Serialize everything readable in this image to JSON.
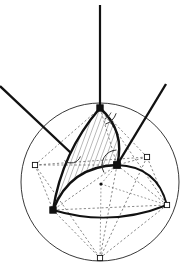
{
  "figure": {
    "type": "geometric-diagram",
    "title": "",
    "caption": "",
    "canvas": {
      "width": 186,
      "height": 278,
      "background": "#ffffff"
    },
    "colors": {
      "stroke_primary": "#111111",
      "stroke_thin": "#333333",
      "stroke_dashed": "#555555",
      "hatch": "#444444",
      "vertex_fill": "#ffffff",
      "vertex_stroke": "#111111"
    },
    "great_circle": {
      "label": "sphere-outline",
      "cx": 100,
      "cy": 182,
      "r": 79,
      "stroke_width": 0.9
    },
    "vertices": [
      {
        "name": "top",
        "x": 100,
        "y": 108,
        "marker": "square",
        "size": 3.2
      },
      {
        "name": "lower-left",
        "x": 53,
        "y": 210,
        "marker": "square",
        "size": 3.2
      },
      {
        "name": "mid-right",
        "x": 117,
        "y": 165,
        "marker": "square",
        "size": 3.4
      },
      {
        "name": "far-right",
        "x": 167,
        "y": 205,
        "marker": "square",
        "size": 2.6
      },
      {
        "name": "far-left",
        "x": 35,
        "y": 165,
        "marker": "square",
        "size": 2.6
      },
      {
        "name": "upper-right",
        "x": 147,
        "y": 157,
        "marker": "square",
        "size": 2.6
      },
      {
        "name": "bottom",
        "x": 100,
        "y": 258,
        "marker": "square",
        "size": 2.6
      },
      {
        "name": "center",
        "x": 101,
        "y": 184,
        "marker": "dot",
        "size": 1.6
      }
    ],
    "spherical_triangle": {
      "name": "hatched-spherical-triangle",
      "arcs": [
        {
          "from": "top",
          "to": "mid-right",
          "bulge": 9,
          "stroke_width": 2.4
        },
        {
          "from": "mid-right",
          "to": "lower-left",
          "bulge": 13,
          "stroke_width": 2.4
        },
        {
          "from": "lower-left",
          "to": "top",
          "bulge": 8,
          "stroke_width": 2.4
        }
      ],
      "hatching": {
        "angle_deg": 20,
        "spacing": 4.5,
        "stroke_width": 0.7
      }
    },
    "spherical_arcs_outer": [
      {
        "name": "arc-midright-farright",
        "from": "mid-right",
        "to": "far-right",
        "bulge": 12,
        "stroke_width": 1.9
      },
      {
        "name": "arc-lowerleft-farright",
        "from": "lower-left",
        "to": "far-right",
        "bulge": 10,
        "stroke_width": 1.9
      }
    ],
    "octahedron_dashed_edges": [
      {
        "from": "far-left",
        "to": "top"
      },
      {
        "from": "far-left",
        "to": "mid-right"
      },
      {
        "from": "far-left",
        "to": "lower-left"
      },
      {
        "from": "far-left",
        "to": "bottom"
      },
      {
        "from": "far-left",
        "to": "upper-right"
      },
      {
        "from": "top",
        "to": "upper-right"
      },
      {
        "from": "top",
        "to": "mid-right"
      },
      {
        "from": "top",
        "to": "far-right"
      },
      {
        "from": "upper-right",
        "to": "mid-right"
      },
      {
        "from": "upper-right",
        "to": "far-right"
      },
      {
        "from": "upper-right",
        "to": "bottom"
      },
      {
        "from": "mid-right",
        "to": "far-right"
      },
      {
        "from": "mid-right",
        "to": "bottom"
      },
      {
        "from": "mid-right",
        "to": "lower-left"
      },
      {
        "from": "lower-left",
        "to": "bottom"
      },
      {
        "from": "lower-left",
        "to": "far-right"
      },
      {
        "from": "far-right",
        "to": "bottom"
      }
    ],
    "center_spokes_dashed": [
      {
        "from": "center",
        "to": "mid-right"
      },
      {
        "from": "center",
        "to": "bottom"
      },
      {
        "from": "center",
        "to": "far-right"
      }
    ],
    "rays": [
      {
        "name": "ray-vertical-top",
        "x1": 100,
        "y1": 5,
        "x2": 100,
        "y2": 108,
        "stroke_width": 2.2
      },
      {
        "name": "ray-upper-left",
        "x1": 0,
        "y1": 86,
        "x2": 71,
        "y2": 153,
        "stroke_width": 2.4
      },
      {
        "name": "ray-upper-right",
        "x1": 166,
        "y1": 84,
        "x2": 117,
        "y2": 165,
        "stroke_width": 2.4
      }
    ],
    "angle_arcs": [
      {
        "name": "angle-arc-top",
        "cx": 100,
        "cy": 108,
        "r": 17,
        "start_deg": 18,
        "end_deg": 72,
        "stroke_width": 1.0
      },
      {
        "name": "angle-arc-top-inner",
        "cx": 100,
        "cy": 108,
        "r": 12,
        "start_deg": 22,
        "end_deg": 68,
        "stroke_width": 0.8
      },
      {
        "name": "angle-arc-midright",
        "cx": 117,
        "cy": 165,
        "r": 15,
        "start_deg": 150,
        "end_deg": 268,
        "stroke_width": 1.0
      },
      {
        "name": "angle-arc-lowerleft",
        "cx": 71,
        "cy": 153,
        "r": 10,
        "start_deg": 20,
        "end_deg": 130,
        "stroke_width": 1.0
      }
    ],
    "annotations": []
  }
}
